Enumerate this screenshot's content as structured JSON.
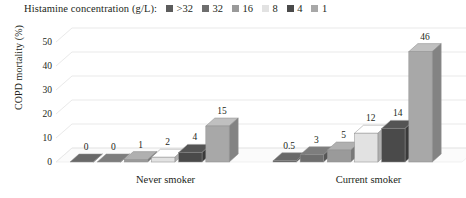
{
  "legend": {
    "title": "Histamine concentration (g/L):",
    "items": [
      {
        "label": ">32",
        "color": "#5c5c5c"
      },
      {
        "label": "32",
        "color": "#6e6e6e"
      },
      {
        "label": "16",
        "color": "#9a9a9a"
      },
      {
        "label": "8",
        "color": "#e2e2e2"
      },
      {
        "label": "4",
        "color": "#4a4a4a"
      },
      {
        "label": "1",
        "color": "#a8a8a8"
      }
    ]
  },
  "axes": {
    "ylabel": "COPD mortality (%)",
    "yticks": [
      "0",
      "10",
      "20",
      "30",
      "40",
      "50"
    ],
    "categories": [
      "Never smoker",
      "Current smoker"
    ]
  },
  "chart_data": {
    "type": "bar",
    "title": "",
    "xlabel": "",
    "ylabel": "COPD mortality (%)",
    "ylim": [
      0,
      50
    ],
    "ytick_values": [
      0,
      10,
      20,
      30,
      40,
      50
    ],
    "grid": true,
    "legend_position": "top",
    "legend_title": "Histamine concentration (g/L)",
    "three_d": true,
    "categories": [
      "Never smoker",
      "Current smoker"
    ],
    "series": [
      {
        "name": ">32",
        "color": "#5c5c5c",
        "values": [
          0,
          0.5
        ],
        "labels": [
          "0",
          "0.5"
        ]
      },
      {
        "name": "32",
        "color": "#6e6e6e",
        "values": [
          0,
          3
        ],
        "labels": [
          "0",
          "3"
        ]
      },
      {
        "name": "16",
        "color": "#9a9a9a",
        "values": [
          1,
          5
        ],
        "labels": [
          "1",
          "5"
        ]
      },
      {
        "name": "8",
        "color": "#e2e2e2",
        "values": [
          2,
          12
        ],
        "labels": [
          "2",
          "12"
        ]
      },
      {
        "name": "4",
        "color": "#4a4a4a",
        "values": [
          4,
          14
        ],
        "labels": [
          "4",
          "14"
        ]
      },
      {
        "name": "1",
        "color": "#a8a8a8",
        "values": [
          15,
          46
        ],
        "labels": [
          "15",
          "46"
        ]
      }
    ]
  }
}
